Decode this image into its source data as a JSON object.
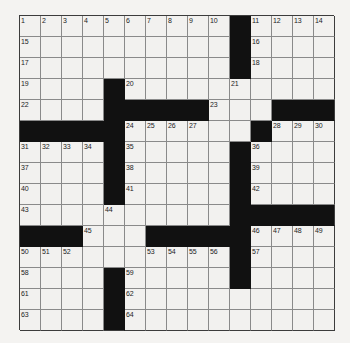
{
  "puzzle": {
    "kind": "crossword-grid",
    "rows": 15,
    "columns": 15,
    "cell_size_px": 21,
    "colors": {
      "block": "#111111",
      "cell": "#f2f1ef",
      "grid_line": "#8a8a8a",
      "border": "#3c3c3c",
      "page_background": "#f4f3f1",
      "number_text": "#1c1c1c"
    },
    "blocks": [
      [
        0,
        10
      ],
      [
        1,
        10
      ],
      [
        2,
        10
      ],
      [
        3,
        4
      ],
      [
        4,
        4
      ],
      [
        4,
        5
      ],
      [
        4,
        6
      ],
      [
        4,
        7
      ],
      [
        4,
        8
      ],
      [
        4,
        12
      ],
      [
        4,
        13
      ],
      [
        4,
        14
      ],
      [
        5,
        0
      ],
      [
        5,
        1
      ],
      [
        5,
        2
      ],
      [
        5,
        3
      ],
      [
        5,
        4
      ],
      [
        5,
        11
      ],
      [
        6,
        4
      ],
      [
        6,
        10
      ],
      [
        7,
        4
      ],
      [
        7,
        10
      ],
      [
        8,
        4
      ],
      [
        8,
        10
      ],
      [
        9,
        10
      ],
      [
        9,
        11
      ],
      [
        9,
        12
      ],
      [
        9,
        13
      ],
      [
        9,
        14
      ],
      [
        10,
        0
      ],
      [
        10,
        1
      ],
      [
        10,
        2
      ],
      [
        10,
        6
      ],
      [
        10,
        7
      ],
      [
        10,
        8
      ],
      [
        10,
        9
      ],
      [
        10,
        10
      ],
      [
        11,
        10
      ],
      [
        12,
        4
      ],
      [
        12,
        10
      ],
      [
        13,
        4
      ],
      [
        14,
        4
      ]
    ],
    "numbers": [
      {
        "row": 0,
        "col": 0,
        "label": "1"
      },
      {
        "row": 0,
        "col": 1,
        "label": "2"
      },
      {
        "row": 0,
        "col": 2,
        "label": "3"
      },
      {
        "row": 0,
        "col": 3,
        "label": "4"
      },
      {
        "row": 0,
        "col": 4,
        "label": "5"
      },
      {
        "row": 0,
        "col": 5,
        "label": "6"
      },
      {
        "row": 0,
        "col": 6,
        "label": "7"
      },
      {
        "row": 0,
        "col": 7,
        "label": "8"
      },
      {
        "row": 0,
        "col": 8,
        "label": "9"
      },
      {
        "row": 0,
        "col": 9,
        "label": "10"
      },
      {
        "row": 0,
        "col": 11,
        "label": "11"
      },
      {
        "row": 0,
        "col": 12,
        "label": "12"
      },
      {
        "row": 0,
        "col": 13,
        "label": "13"
      },
      {
        "row": 0,
        "col": 14,
        "label": "14"
      },
      {
        "row": 1,
        "col": 0,
        "label": "15"
      },
      {
        "row": 1,
        "col": 11,
        "label": "16"
      },
      {
        "row": 2,
        "col": 0,
        "label": "17"
      },
      {
        "row": 2,
        "col": 11,
        "label": "18"
      },
      {
        "row": 3,
        "col": 0,
        "label": "19"
      },
      {
        "row": 3,
        "col": 5,
        "label": "20"
      },
      {
        "row": 3,
        "col": 10,
        "label": "21"
      },
      {
        "row": 4,
        "col": 0,
        "label": "22"
      },
      {
        "row": 4,
        "col": 9,
        "label": "23"
      },
      {
        "row": 5,
        "col": 5,
        "label": "24"
      },
      {
        "row": 5,
        "col": 6,
        "label": "25"
      },
      {
        "row": 5,
        "col": 7,
        "label": "26"
      },
      {
        "row": 5,
        "col": 8,
        "label": "27"
      },
      {
        "row": 5,
        "col": 12,
        "label": "28"
      },
      {
        "row": 5,
        "col": 13,
        "label": "29"
      },
      {
        "row": 5,
        "col": 14,
        "label": "30"
      },
      {
        "row": 6,
        "col": 0,
        "label": "31"
      },
      {
        "row": 6,
        "col": 1,
        "label": "32"
      },
      {
        "row": 6,
        "col": 2,
        "label": "33"
      },
      {
        "row": 6,
        "col": 3,
        "label": "34"
      },
      {
        "row": 6,
        "col": 5,
        "label": "35"
      },
      {
        "row": 6,
        "col": 11,
        "label": "36"
      },
      {
        "row": 7,
        "col": 0,
        "label": "37"
      },
      {
        "row": 7,
        "col": 5,
        "label": "38"
      },
      {
        "row": 7,
        "col": 11,
        "label": "39"
      },
      {
        "row": 8,
        "col": 0,
        "label": "40"
      },
      {
        "row": 8,
        "col": 5,
        "label": "41"
      },
      {
        "row": 8,
        "col": 11,
        "label": "42"
      },
      {
        "row": 9,
        "col": 0,
        "label": "43"
      },
      {
        "row": 9,
        "col": 4,
        "label": "44"
      },
      {
        "row": 10,
        "col": 3,
        "label": "45"
      },
      {
        "row": 10,
        "col": 11,
        "label": "46"
      },
      {
        "row": 10,
        "col": 12,
        "label": "47"
      },
      {
        "row": 10,
        "col": 13,
        "label": "48"
      },
      {
        "row": 10,
        "col": 14,
        "label": "49"
      },
      {
        "row": 11,
        "col": 0,
        "label": "50"
      },
      {
        "row": 11,
        "col": 1,
        "label": "51"
      },
      {
        "row": 11,
        "col": 2,
        "label": "52"
      },
      {
        "row": 11,
        "col": 6,
        "label": "53"
      },
      {
        "row": 11,
        "col": 7,
        "label": "54"
      },
      {
        "row": 11,
        "col": 8,
        "label": "55"
      },
      {
        "row": 11,
        "col": 9,
        "label": "56"
      },
      {
        "row": 11,
        "col": 11,
        "label": "57"
      },
      {
        "row": 12,
        "col": 0,
        "label": "58"
      },
      {
        "row": 12,
        "col": 5,
        "label": "59"
      },
      {
        "row": 12,
        "col": 10,
        "label": "60"
      },
      {
        "row": 13,
        "col": 0,
        "label": "61"
      },
      {
        "row": 13,
        "col": 5,
        "label": "62"
      },
      {
        "row": 14,
        "col": 0,
        "label": "63"
      },
      {
        "row": 14,
        "col": 5,
        "label": "64"
      }
    ]
  }
}
